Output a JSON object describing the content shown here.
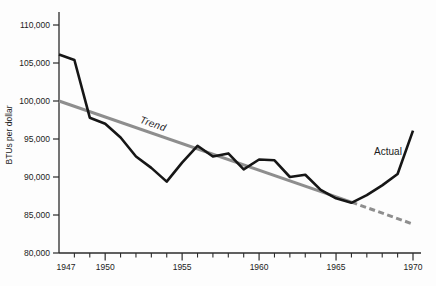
{
  "figure": {
    "background": "#fdfdfd",
    "axis_color": "#2b2b2b",
    "text_color": "#1c1c1c",
    "actual_color": "#161616",
    "trend_color": "#8e8e8e"
  },
  "chart_data": {
    "type": "line",
    "title": "",
    "xlabel": "",
    "ylabel": "BTUs per dollar",
    "xlim": [
      1947,
      1970
    ],
    "ylim": [
      80000,
      110000
    ],
    "grid": false,
    "legend": "inline-labels",
    "y_ticks": [
      110000,
      105000,
      100000,
      95000,
      90000,
      85000,
      80000
    ],
    "y_tick_labels": [
      "110,000",
      "105,000",
      "100,000",
      "95,000",
      "90,000",
      "85,000",
      "80,000"
    ],
    "x_ticks_major": [
      {
        "label": "1947",
        "year": 1947,
        "tick": false,
        "dx": 7
      },
      {
        "label": "1950",
        "year": 1950,
        "tick": true,
        "dx": 0
      },
      {
        "label": "1955",
        "year": 1955,
        "tick": true,
        "dx": 0
      },
      {
        "label": "1960",
        "year": 1960,
        "tick": true,
        "dx": 0
      },
      {
        "label": "1965",
        "year": 1965,
        "tick": true,
        "dx": 0
      },
      {
        "label": "1970",
        "year": 1970,
        "tick": true,
        "dx": 0
      }
    ],
    "x_ticks_minor_years": [
      1948,
      1949,
      1951,
      1952,
      1953,
      1954,
      1956,
      1957,
      1958,
      1959,
      1961,
      1962,
      1963,
      1964,
      1966,
      1967,
      1968,
      1969
    ],
    "series": [
      {
        "name": "Actual",
        "color_key": "actual",
        "style": "solid",
        "width": 2.6,
        "x": [
          1947,
          1948,
          1949,
          1950,
          1951,
          1952,
          1953,
          1954,
          1955,
          1956,
          1957,
          1958,
          1959,
          1960,
          1961,
          1962,
          1963,
          1964,
          1965,
          1966,
          1967,
          1968,
          1969,
          1970
        ],
        "values": [
          106100,
          105400,
          97800,
          97000,
          95200,
          92700,
          91200,
          89400,
          91900,
          94100,
          92700,
          93100,
          91000,
          92300,
          92200,
          90000,
          90300,
          88300,
          87200,
          86600,
          87600,
          88900,
          90400,
          96100
        ]
      },
      {
        "name": "Trend",
        "color_key": "trend",
        "style": "solid",
        "width": 3,
        "x": [
          1947,
          1966
        ],
        "values": [
          100000,
          86700
        ]
      },
      {
        "name": "Trend projection",
        "color_key": "trend",
        "style": "dashed",
        "width": 3,
        "x": [
          1966,
          1970
        ],
        "values": [
          86700,
          83800
        ]
      }
    ],
    "annotations": [
      {
        "text": "Trend",
        "px": 152,
        "py": 127,
        "rotate": 19
      },
      {
        "text": "Actual",
        "px": 388,
        "py": 155,
        "rotate": 0
      }
    ]
  }
}
